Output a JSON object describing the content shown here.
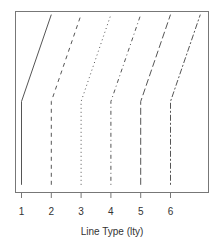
{
  "chart_data": {
    "type": "line",
    "title": "",
    "xlabel": "Line Type (lty)",
    "ylabel": "",
    "xlim": [
      0.95,
      7.0
    ],
    "ylim": [
      0,
      1
    ],
    "grid": false,
    "legend": null,
    "x_ticks": [
      "1",
      "2",
      "3",
      "4",
      "5",
      "6"
    ],
    "series": [
      {
        "name": "lty 1",
        "lty": "solid",
        "points": [
          [
            1,
            0.04
          ],
          [
            1,
            0.5
          ],
          [
            2,
            0.98
          ]
        ]
      },
      {
        "name": "lty 2",
        "lty": "dashed",
        "points": [
          [
            2,
            0.04
          ],
          [
            2,
            0.5
          ],
          [
            3,
            0.98
          ]
        ]
      },
      {
        "name": "lty 3",
        "lty": "dotted",
        "points": [
          [
            3,
            0.04
          ],
          [
            3,
            0.5
          ],
          [
            4,
            0.98
          ]
        ]
      },
      {
        "name": "lty 4",
        "lty": "dotdash",
        "points": [
          [
            4,
            0.04
          ],
          [
            4,
            0.5
          ],
          [
            5,
            0.98
          ]
        ]
      },
      {
        "name": "lty 5",
        "lty": "longdash",
        "points": [
          [
            5,
            0.04
          ],
          [
            5,
            0.5
          ],
          [
            6,
            0.98
          ]
        ]
      },
      {
        "name": "lty 6",
        "lty": "twodash",
        "points": [
          [
            6,
            0.04
          ],
          [
            6,
            0.5
          ],
          [
            7,
            0.98
          ]
        ]
      }
    ]
  },
  "colors": {
    "line": "#555555",
    "box": "#777777",
    "text": "#333333"
  }
}
